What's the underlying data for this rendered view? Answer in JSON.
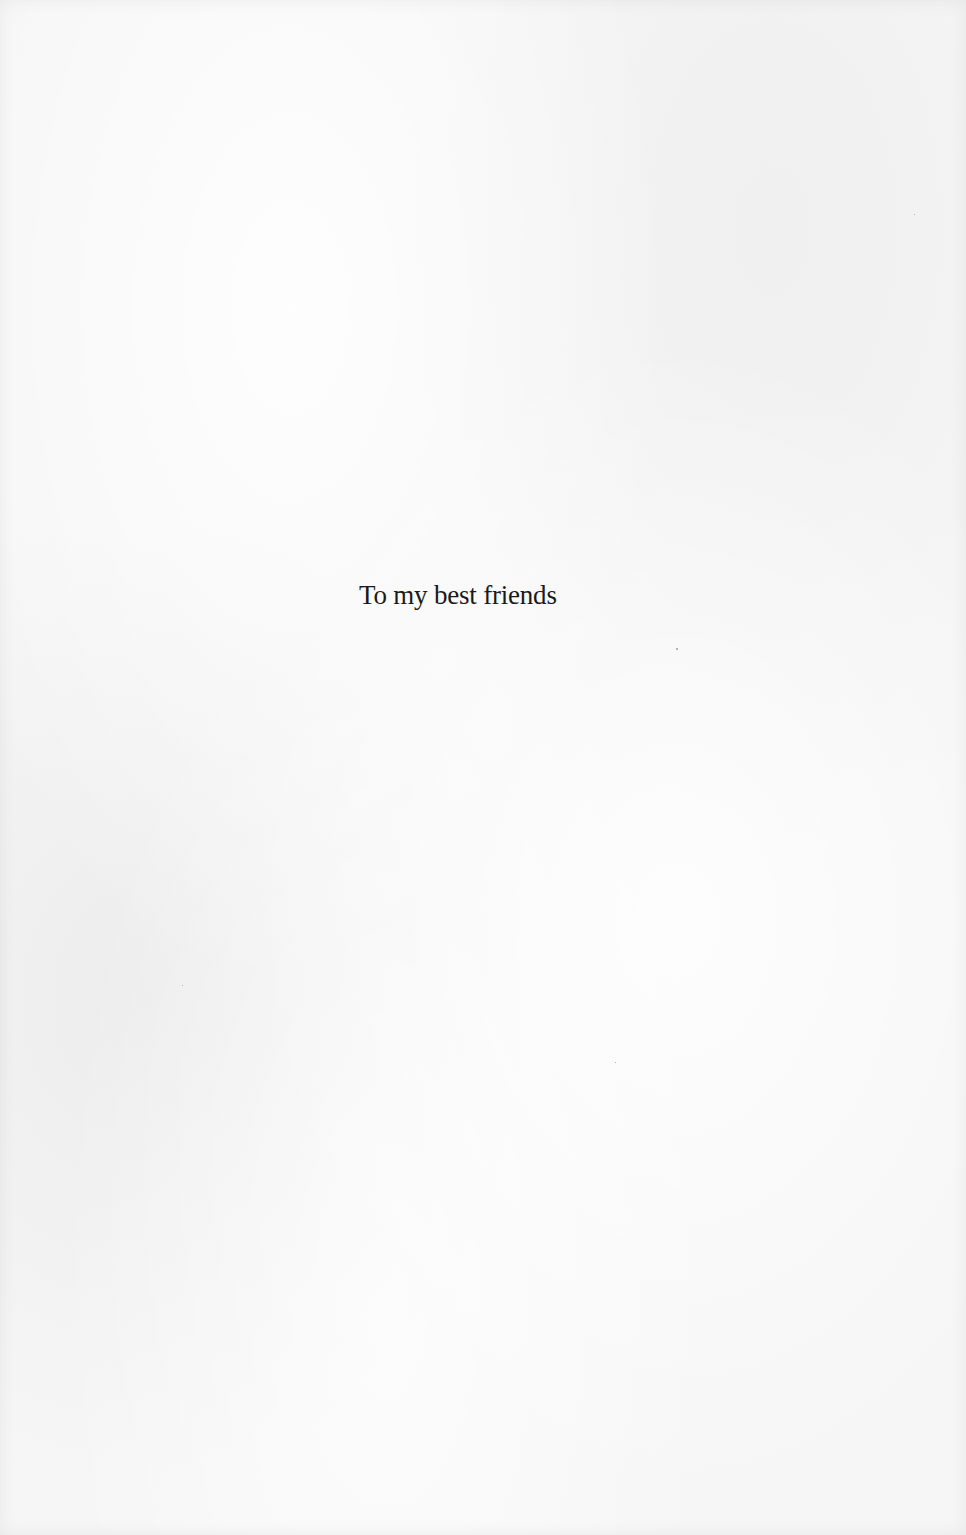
{
  "page": {
    "dedication": "To my best friends",
    "background_color": "#f6f6f6",
    "text_color": "#1a1a1a"
  }
}
